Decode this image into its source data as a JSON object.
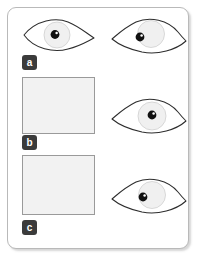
{
  "figure": {
    "panel_labels": [
      {
        "id": "a",
        "text": "a"
      },
      {
        "id": "b",
        "text": "b"
      },
      {
        "id": "c",
        "text": "c"
      }
    ],
    "panels": [
      {
        "id": "panel-a",
        "caption": ""
      },
      {
        "id": "panel-b",
        "caption": ""
      }
    ],
    "eyes": [
      {
        "id": "eye-top-left",
        "icon": "eye-icon",
        "column": "left",
        "row": "a",
        "gaze": "center",
        "tail_side": "right"
      },
      {
        "id": "eye-right-top",
        "icon": "eye-icon",
        "column": "right",
        "row": "a",
        "gaze": "left",
        "tail_side": "left"
      },
      {
        "id": "eye-right-middle",
        "icon": "eye-icon",
        "column": "right",
        "row": "b",
        "gaze": "center",
        "tail_side": "left"
      },
      {
        "id": "eye-right-bottom",
        "icon": "eye-icon",
        "column": "right",
        "row": "c",
        "gaze": "left",
        "tail_side": "left"
      }
    ],
    "colors": {
      "card_background": "#ffffff",
      "card_border": "#b9b9b9",
      "panel_fill": "#f2f2f2",
      "panel_border": "#9a9a9a",
      "badge_background": "#3b3b3b",
      "badge_text": "#ffffff",
      "eye_outline": "#2d2d2d",
      "iris_fill": "#f0f0f0",
      "pupil_fill": "#111111"
    }
  }
}
